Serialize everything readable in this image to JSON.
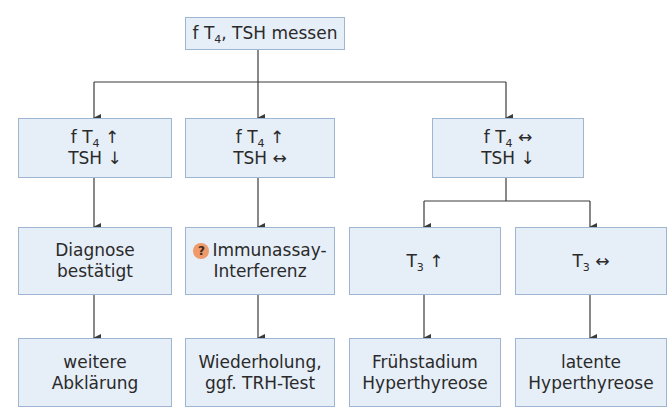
{
  "diagram": {
    "root": {
      "prefix": "f T",
      "sub": "4",
      "suffix": ", TSH messen"
    },
    "level1": [
      {
        "line1_prefix": "f T",
        "line1_sub": "4",
        "line1_arrow": "↑",
        "line2": "TSH ↓"
      },
      {
        "line1_prefix": "f T",
        "line1_sub": "4",
        "line1_arrow": "↑",
        "line2": "TSH ↔"
      },
      {
        "line1_prefix": "f T",
        "line1_sub": "4",
        "line1_arrow": "↔",
        "line2": "TSH ↓"
      }
    ],
    "level2": [
      {
        "line1": "Diagnose",
        "line2": "bestätigt"
      },
      {
        "icon": "?",
        "line1": "Immunassay-",
        "line2": "Interferenz"
      },
      {
        "prefix": "T",
        "sub": "3",
        "arrow": "↑"
      },
      {
        "prefix": "T",
        "sub": "3",
        "arrow": "↔"
      }
    ],
    "level3": [
      {
        "line1": "weitere",
        "line2": "Abklärung"
      },
      {
        "line1": "Wiederholung,",
        "line2": "ggf. TRH-Test"
      },
      {
        "line1": "Frühstadium",
        "line2": "Hyperthyreose"
      },
      {
        "line1": "latente",
        "line2": "Hyperthyreose"
      }
    ],
    "colors": {
      "box_fill": "#e6eef8",
      "box_border": "#9fb6d3",
      "line": "#3a3a3a",
      "question_badge": "#ef9a6a"
    }
  }
}
